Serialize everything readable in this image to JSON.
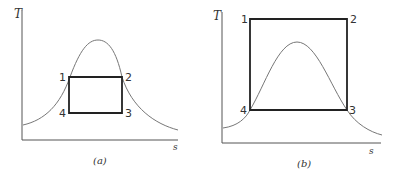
{
  "figure": {
    "panels": [
      {
        "id": "a",
        "caption": "(a)",
        "y_axis_label": "T",
        "x_axis_label": "s",
        "points": [
          {
            "label": "1",
            "x": 69,
            "y": 77
          },
          {
            "label": "2",
            "x": 122,
            "y": 77
          },
          {
            "label": "3",
            "x": 122,
            "y": 113
          },
          {
            "label": "4",
            "x": 69,
            "y": 113
          }
        ],
        "description": "Rectangular cycle 1-2-3-4 inside the saturation dome"
      },
      {
        "id": "b",
        "caption": "(b)",
        "y_axis_label": "T",
        "x_axis_label": "s",
        "points": [
          {
            "label": "1",
            "x": 250,
            "y": 19
          },
          {
            "label": "2",
            "x": 347,
            "y": 19
          },
          {
            "label": "3",
            "x": 347,
            "y": 110
          },
          {
            "label": "4",
            "x": 250,
            "y": 110
          }
        ],
        "description": "Rectangular cycle 1-2-3-4 extending above the saturation dome"
      }
    ]
  }
}
